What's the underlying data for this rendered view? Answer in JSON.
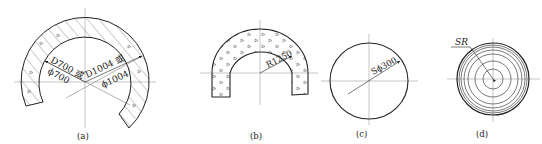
{
  "figures": [
    {
      "id": "a",
      "caption": "(a)",
      "type": "hatched-arch-annulus",
      "dimensions": {
        "inner_line1": "D700 或",
        "inner_line2": "ϕ700",
        "outer_line1": "D1004 或",
        "outer_line2": "ϕ1004"
      }
    },
    {
      "id": "b",
      "caption": "(b)",
      "type": "concrete-u-arch",
      "dimensions": {
        "radius": "R1250"
      }
    },
    {
      "id": "c",
      "caption": "(c)",
      "type": "sphere",
      "dimensions": {
        "diameter": "Sϕ300"
      }
    },
    {
      "id": "d",
      "caption": "(d)",
      "type": "concentric-sphere",
      "dimensions": {
        "radius": "SR"
      }
    }
  ],
  "colors": {
    "line": "#222222",
    "centerline": "#888888",
    "background": "#ffffff"
  }
}
